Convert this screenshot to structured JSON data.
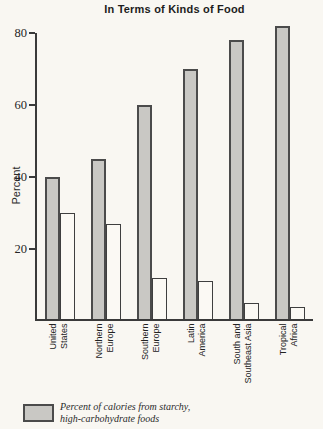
{
  "chart_data": {
    "type": "bar",
    "title": "In Terms of Kinds of Food",
    "xlabel": "",
    "ylabel": "Percent",
    "ylim": [
      0,
      85
    ],
    "yticks": [
      20,
      40,
      60,
      80
    ],
    "grid": false,
    "legend_position": "bottom-left",
    "categories": [
      "United States",
      "Northern Europe",
      "Southern Europe",
      "Latin America",
      "South and Southeast Asia",
      "Tropical Africa"
    ],
    "category_label_lines": [
      [
        "United",
        "States"
      ],
      [
        "Northern",
        "Europe"
      ],
      [
        "Southern",
        "Europe"
      ],
      [
        "Latin",
        "America"
      ],
      [
        "South and",
        "Southeast Asia"
      ],
      [
        "Tropical",
        "Africa"
      ]
    ],
    "series": [
      {
        "key": "starchy",
        "name": "Percent of calories from starchy, high-carbohydrate foods",
        "color": "#c9c8c4",
        "values": [
          40,
          45,
          60,
          70,
          78,
          82
        ]
      },
      {
        "key": "other",
        "name": "",
        "color": "#fbf9f4",
        "values": [
          30,
          27,
          12,
          11,
          5,
          4
        ]
      }
    ],
    "legend": {
      "line1": "Percent of calories from starchy,",
      "line2": "high-carbohydrate foods"
    },
    "colors": {
      "background": "#f9f7f2",
      "bar_fill": "#c9c8c4",
      "bar_outline": "#4b4b4b",
      "axis": "#3a3a3a",
      "text": "#222222"
    }
  }
}
